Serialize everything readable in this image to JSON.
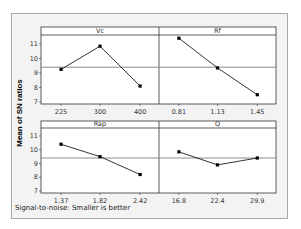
{
  "chart_data": {
    "type": "line",
    "ylabel": "Mean of SN ratios",
    "footnote": "Signal-to-noise: Smaller is better",
    "ylim": [
      7,
      12
    ],
    "yticks": [
      7,
      8,
      9,
      10,
      11
    ],
    "grand_mean": 9.4,
    "panels": [
      {
        "name": "Vc",
        "categories": [
          "225",
          "300",
          "400"
        ],
        "values": [
          9.25,
          10.85,
          8.1
        ]
      },
      {
        "name": "Rf",
        "categories": [
          "0.81",
          "1.13",
          "1.45"
        ],
        "values": [
          11.4,
          9.35,
          7.5
        ]
      },
      {
        "name": "Rap",
        "categories": [
          "1.37",
          "1.82",
          "2.42"
        ],
        "values": [
          10.4,
          9.5,
          8.2
        ]
      },
      {
        "name": "Q",
        "categories": [
          "16.8",
          "22.4",
          "29.9"
        ],
        "values": [
          9.85,
          8.9,
          9.4
        ]
      }
    ],
    "grid": false,
    "layout": "2x2"
  },
  "colors": {
    "frame_bg": "#f3f3f3",
    "frame_border": "#a9a9a9",
    "panel_bg": "#ffffff",
    "line": "#000000",
    "mean_line": "#808080"
  }
}
